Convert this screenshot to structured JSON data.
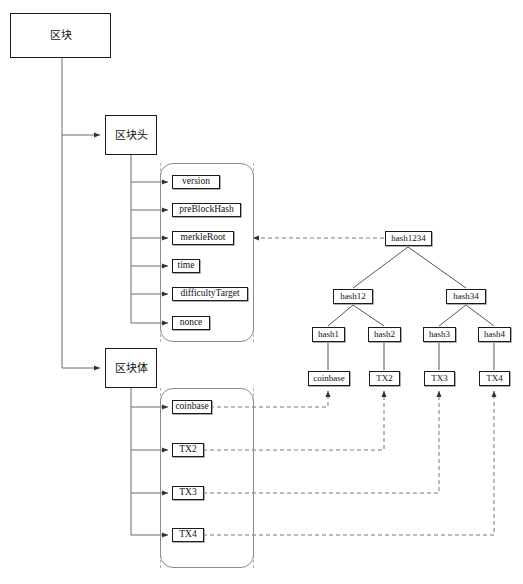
{
  "diagram": {
    "title_nodes": {
      "block": "区块",
      "block_header": "区块头",
      "block_body": "区块体"
    },
    "header_fields": [
      {
        "id": "version",
        "label": "version"
      },
      {
        "id": "preBlockHash",
        "label": "preBlockHash"
      },
      {
        "id": "merkleRoot",
        "label": "merkleRoot"
      },
      {
        "id": "time",
        "label": "time"
      },
      {
        "id": "difficultyTarget",
        "label": "difficultyTarget"
      },
      {
        "id": "nonce",
        "label": "nonce"
      }
    ],
    "body_transactions": [
      {
        "id": "coinbase",
        "label": "coinbase"
      },
      {
        "id": "tx2",
        "label": "TX2"
      },
      {
        "id": "tx3",
        "label": "TX3"
      },
      {
        "id": "tx4",
        "label": "TX4"
      }
    ],
    "merkle_tree": {
      "root": {
        "id": "hash1234",
        "label": "hash1234"
      },
      "level2": [
        {
          "id": "hash12",
          "label": "hash12"
        },
        {
          "id": "hash34",
          "label": "hash34"
        }
      ],
      "level3": [
        {
          "id": "hash1",
          "label": "hash1"
        },
        {
          "id": "hash2",
          "label": "hash2"
        },
        {
          "id": "hash3",
          "label": "hash3"
        },
        {
          "id": "hash4",
          "label": "hash4"
        }
      ],
      "leaves": [
        {
          "id": "coinbase",
          "label": "coinbase"
        },
        {
          "id": "tx2",
          "label": "TX2"
        },
        {
          "id": "tx3",
          "label": "TX3"
        },
        {
          "id": "tx4",
          "label": "TX4"
        }
      ]
    },
    "colors": {
      "stroke": "#1a1a1a",
      "connector": "#6b6b6b",
      "dashed": "#8d8d8d",
      "group_border": "#8d8d8d",
      "background": "#ffffff"
    }
  }
}
